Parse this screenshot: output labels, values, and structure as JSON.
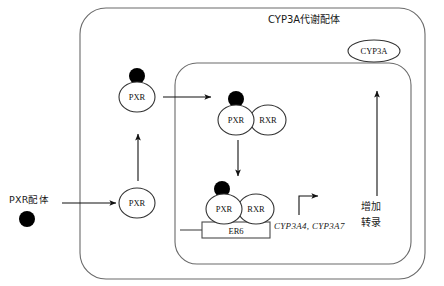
{
  "figure": {
    "title": "CYP3A代谢配体",
    "title_position": {
      "x": 268,
      "y": 16
    },
    "background_color": "#ffffff",
    "line_color": "#555555",
    "text_color": "#1a1a1a",
    "ligand_color": "#000000"
  },
  "compartments": [
    {
      "name": "cell-outer-boundary",
      "label": "",
      "x": 80,
      "y": 8,
      "width": 345,
      "height": 271,
      "radius": 26
    },
    {
      "name": "nucleus-boundary",
      "label": "",
      "x": 175,
      "y": 63,
      "width": 236,
      "height": 201,
      "radius": 22
    }
  ],
  "nodes": [
    {
      "id": "pxr-ligand-free",
      "label": "PXR配体",
      "type": "text-label",
      "x": 10,
      "y": 196
    },
    {
      "id": "ligand-dot-free",
      "label": "",
      "type": "ligand-dot",
      "cx": 27,
      "cy": 219,
      "r": 8
    },
    {
      "id": "pxr-cytoplasm-unbound",
      "label": "PXR",
      "type": "receptor-circle",
      "cx": 137,
      "cy": 203,
      "rx": 18,
      "ry": 15
    },
    {
      "id": "pxr-cytoplasm-bound",
      "label": "PXR",
      "type": "receptor-circle",
      "cx": 137,
      "cy": 97,
      "rx": 18,
      "ry": 15
    },
    {
      "id": "ligand-dot-cytoplasm",
      "label": "",
      "type": "ligand-dot",
      "cx": 137,
      "cy": 76,
      "r": 8
    },
    {
      "id": "pxr-nucleus-dimer",
      "label": "PXR",
      "type": "receptor-circle",
      "cx": 236,
      "cy": 120,
      "rx": 18,
      "ry": 15
    },
    {
      "id": "rxr-nucleus-dimer",
      "label": "RXR",
      "type": "receptor-circle",
      "cx": 268,
      "cy": 120,
      "rx": 18,
      "ry": 15
    },
    {
      "id": "ligand-dot-nucleus-dimer",
      "label": "",
      "type": "ligand-dot",
      "cx": 236,
      "cy": 99,
      "r": 8
    },
    {
      "id": "pxr-dna-bound",
      "label": "PXR",
      "type": "receptor-circle",
      "cx": 224,
      "cy": 209,
      "rx": 18,
      "ry": 15
    },
    {
      "id": "rxr-dna-bound",
      "label": "RXR",
      "type": "receptor-circle",
      "cx": 256,
      "cy": 209,
      "rx": 18,
      "ry": 15
    },
    {
      "id": "ligand-dot-dna",
      "label": "",
      "type": "ligand-dot",
      "cx": 222,
      "cy": 189,
      "r": 8
    },
    {
      "id": "cyp3a-enzyme",
      "label": "CYP3A",
      "type": "enzyme-ellipse",
      "cx": 374,
      "cy": 51,
      "rx": 26,
      "ry": 11
    },
    {
      "id": "er6-response-element",
      "label": "ER6",
      "type": "dna-element-box",
      "x": 202,
      "y": 222,
      "width": 68,
      "height": 16
    }
  ],
  "gene_label": {
    "text": "CYP3A4, CYP3A7",
    "x": 274,
    "y": 222
  },
  "transcription_label": {
    "line1": "增加",
    "line2": "转录",
    "x": 361,
    "y": 200
  },
  "arrows": [
    {
      "name": "ligand-entry-arrow",
      "from": [
        62,
        203
      ],
      "to": [
        118,
        203
      ],
      "type": "straight"
    },
    {
      "name": "pxr-activation-arrow",
      "from": [
        138,
        181
      ],
      "to": [
        138,
        133
      ],
      "type": "straight"
    },
    {
      "name": "nuclear-translocation-arrow",
      "from": [
        163,
        97
      ],
      "to": [
        212,
        97
      ],
      "type": "straight"
    },
    {
      "name": "dimer-to-dna-arrow",
      "from": [
        238,
        140
      ],
      "to": [
        238,
        177
      ],
      "type": "straight"
    },
    {
      "name": "transcription-start-arrow",
      "from": [
        298,
        216
      ],
      "to": [
        322,
        196
      ],
      "type": "elbow"
    },
    {
      "name": "enzyme-production-arrow",
      "from": [
        377,
        196
      ],
      "to": [
        377,
        90
      ],
      "type": "straight"
    }
  ],
  "dna_backbone": {
    "name": "dna-strand-line",
    "from": [
      181,
      230
    ],
    "to": [
      202,
      230
    ]
  }
}
